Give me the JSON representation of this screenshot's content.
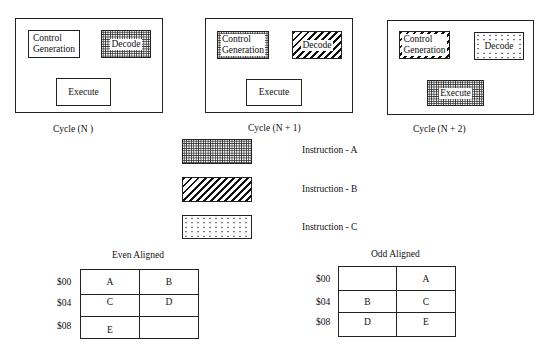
{
  "cycles": [
    {
      "caption": "Cycle (N )",
      "units": {
        "control": {
          "line1": "Control",
          "line2": "Generation",
          "pattern": "none"
        },
        "decode": {
          "label": "Decode",
          "pattern": "instruction-a"
        },
        "execute": {
          "label": "Execute",
          "pattern": "none"
        }
      }
    },
    {
      "caption": "Cycle (N + 1)",
      "units": {
        "control": {
          "line1": "Control",
          "line2": "Generation",
          "pattern": "instruction-a"
        },
        "decode": {
          "label": "Decode",
          "pattern": "instruction-b"
        },
        "execute": {
          "label": "Execute",
          "pattern": "none"
        }
      }
    },
    {
      "caption": "Cycle (N + 2)",
      "units": {
        "control": {
          "line1": "Control",
          "line2": "Generation",
          "pattern": "instruction-b"
        },
        "decode": {
          "label": "Decode",
          "pattern": "instruction-c"
        },
        "execute": {
          "label": "Execute",
          "pattern": "instruction-a"
        }
      }
    }
  ],
  "legend": [
    {
      "label": "Instruction - A",
      "pattern": "dense-crosshatch"
    },
    {
      "label": "Instruction - B",
      "pattern": "diagonal-stripes"
    },
    {
      "label": "Instruction - C",
      "pattern": "sparse-dots"
    }
  ],
  "memory": {
    "even": {
      "title": "Even Aligned",
      "rows": [
        {
          "addr": "$00",
          "cells": [
            "A",
            "B"
          ]
        },
        {
          "addr": "$04",
          "cells": [
            "C",
            "D"
          ]
        },
        {
          "addr": "$08",
          "cells": [
            "E",
            ""
          ]
        }
      ]
    },
    "odd": {
      "title": "Odd Aligned",
      "rows": [
        {
          "addr": "$00",
          "cells": [
            "",
            "A"
          ]
        },
        {
          "addr": "$04",
          "cells": [
            "B",
            "C"
          ]
        },
        {
          "addr": "$08",
          "cells": [
            "D",
            "E"
          ]
        }
      ]
    }
  }
}
